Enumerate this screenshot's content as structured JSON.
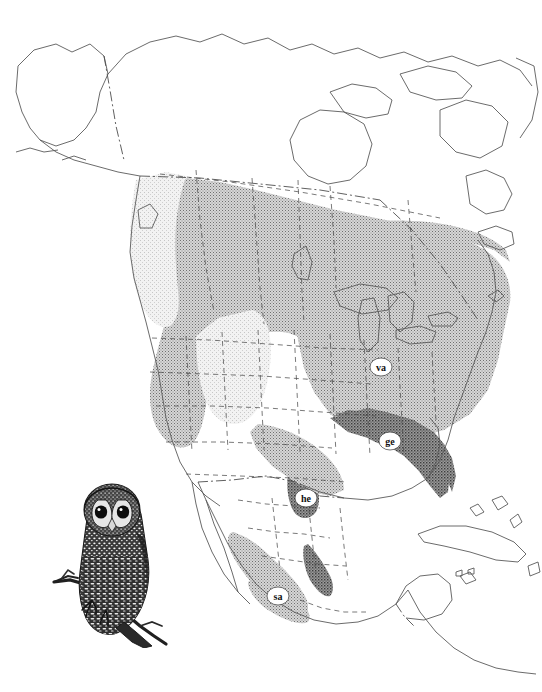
{
  "figure": {
    "kind": "species-range-map",
    "region": "North America",
    "title": "",
    "caption": "",
    "background_color": "#ffffff",
    "outline_color": "#4a4a4a",
    "border_color": "#5a5a5a"
  },
  "illustration": {
    "name": "spotted-owl-illustration",
    "subject": "Spotted Owl perched on branch",
    "alt": "ink-stipple drawing of an owl perched on a branch, facing forward",
    "ink_color": "#1a1a1a"
  },
  "range_labels": [
    {
      "id": "va",
      "text": "va",
      "x": 381,
      "y": 367,
      "rx": 11,
      "ry": 9
    },
    {
      "id": "ge",
      "text": "ge",
      "x": 390,
      "y": 441,
      "rx": 11,
      "ry": 9
    },
    {
      "id": "he",
      "text": "he",
      "x": 306,
      "y": 498,
      "rx": 11,
      "ry": 9
    },
    {
      "id": "sa",
      "text": "sa",
      "x": 278,
      "y": 596,
      "rx": 11,
      "ry": 9
    }
  ],
  "shading": {
    "light": {
      "name": "light-stipple",
      "color": "#dcdcdc",
      "dot": "#b9b9b9",
      "description": "Pacific coastal zone"
    },
    "medium": {
      "name": "medium-stipple",
      "color": "#b0b0b0",
      "dot": "#7a7a7a",
      "description": "main continental range"
    },
    "dark": {
      "name": "dark-stipple",
      "color": "#8a8a8a",
      "dot": "#4e4e4e",
      "description": "Gulf / southeastern zone"
    }
  },
  "boundaries": {
    "coastline": {
      "name": "coastline",
      "style": "solid",
      "color": "#555555"
    },
    "internal": {
      "name": "state-province-boundary",
      "style": "dashed",
      "color": "#4e4e4e"
    },
    "national": {
      "name": "national-boundary",
      "style": "dash-dot",
      "color": "#4e4e4e"
    }
  }
}
